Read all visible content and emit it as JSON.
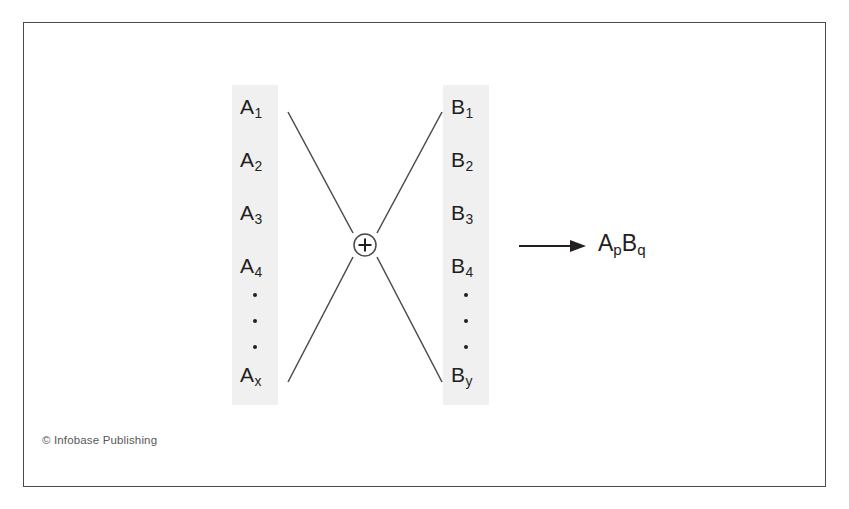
{
  "figure": {
    "type": "diagram",
    "border_color": "#4a4a4a",
    "band_color": "#f0f0f0",
    "ink_color": "#231f20"
  },
  "columns": [
    {
      "id": "column-a",
      "name": "reactant-column-a",
      "items": [
        {
          "base": "A",
          "sub": "1"
        },
        {
          "base": "A",
          "sub": "2"
        },
        {
          "base": "A",
          "sub": "3"
        },
        {
          "base": "A",
          "sub": "4"
        },
        {
          "base": "A",
          "sub": "x"
        }
      ],
      "ellipsis_dots": 3
    },
    {
      "id": "column-b",
      "name": "reactant-column-b",
      "items": [
        {
          "base": "B",
          "sub": "1"
        },
        {
          "base": "B",
          "sub": "2"
        },
        {
          "base": "B",
          "sub": "3"
        },
        {
          "base": "B",
          "sub": "4"
        },
        {
          "base": "B",
          "sub": "y"
        }
      ],
      "ellipsis_dots": 3
    }
  ],
  "combiner": {
    "name": "plus-operator",
    "symbol": "+",
    "shape": "circled"
  },
  "arrow": {
    "name": "reaction-arrow",
    "direction": "right"
  },
  "product": {
    "name": "product-term",
    "parts": [
      {
        "base": "A",
        "sub": "p"
      },
      {
        "base": "B",
        "sub": "q"
      }
    ],
    "text": "ApBq"
  },
  "credit": {
    "text": "© Infobase Publishing"
  }
}
